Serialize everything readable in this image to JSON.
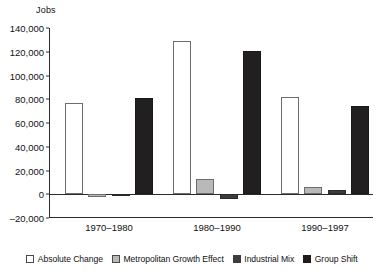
{
  "chart_data": {
    "type": "bar",
    "title": "",
    "subtitle": "",
    "xlabel": "",
    "ylabel": "Jobs",
    "ylim": [
      -20000,
      140000
    ],
    "ytick_step": 20000,
    "ytick_labels": [
      "140,000",
      "120,000",
      "100,000",
      "80,000",
      "60,000",
      "40,000",
      "20,000",
      "0",
      "–20,000"
    ],
    "ytick_values": [
      140000,
      120000,
      100000,
      80000,
      60000,
      40000,
      20000,
      0,
      -20000
    ],
    "grid": false,
    "legend_position": "bottom",
    "categories": [
      "1970–1980",
      "1980–1990",
      "1990–1997"
    ],
    "series": [
      {
        "name": "Absolute Change",
        "color": "#ffffff",
        "values": [
          77000,
          129000,
          82000
        ]
      },
      {
        "name": "Metropolitan Growth Effect",
        "color": "#b9b9b9",
        "values": [
          -2000,
          13000,
          6500
        ]
      },
      {
        "name": "Industrial Mix",
        "color": "#3c3c3c",
        "values": [
          -1500,
          -4000,
          4000
        ]
      },
      {
        "name": "Group Shift",
        "color": "#211f1f",
        "values": [
          81000,
          121000,
          74500
        ]
      }
    ]
  },
  "axis": {
    "y_title": "Jobs"
  },
  "legend": {
    "items": [
      {
        "label": "Absolute Change",
        "swatch": "swatch-white"
      },
      {
        "label": "Metropolitan Growth Effect",
        "swatch": "swatch-light-gray"
      },
      {
        "label": "Industrial Mix",
        "swatch": "swatch-dark-gray"
      },
      {
        "label": "Group Shift",
        "swatch": "swatch-black"
      }
    ]
  }
}
